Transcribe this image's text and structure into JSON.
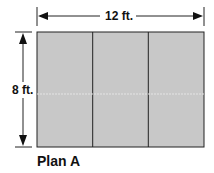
{
  "diagram": {
    "title": "Plan A",
    "width_label": "12 ft.",
    "height_label": "8 ft.",
    "sections": 3,
    "colors": {
      "fill": "#c8c8c8",
      "stroke": "#222222",
      "arrow": "#111111"
    }
  }
}
